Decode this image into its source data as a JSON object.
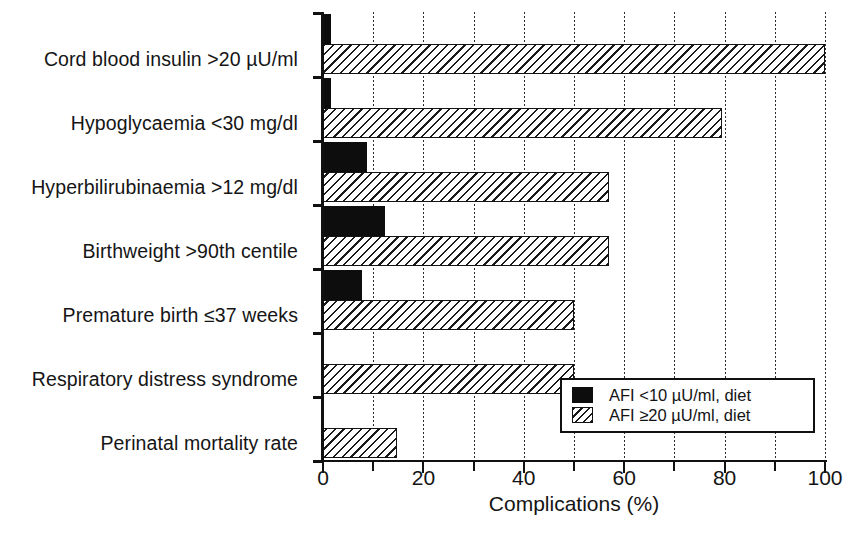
{
  "chart_data": {
    "type": "bar",
    "orientation": "horizontal",
    "title": "",
    "xlabel": "Complications (%)",
    "ylabel": "",
    "xlim": [
      0,
      100
    ],
    "xticks": [
      0,
      20,
      40,
      60,
      80,
      100
    ],
    "xtick_labels": [
      "0",
      "20",
      "40",
      "60",
      "80",
      "100"
    ],
    "minor_xticks": [
      10,
      30,
      50,
      70,
      90
    ],
    "gridlines": {
      "x_every": 10,
      "style": "dotted",
      "y": false
    },
    "categories": [
      "Cord blood insulin >20 µU/ml",
      "Hypoglycaemia <30 mg/dl",
      "Hyperbilirubinaemia >12 mg/dl",
      "Birthweight >90th centile",
      "Premature birth ≤37 weeks",
      "Respiratory distress syndrome",
      "Perinatal mortality rate"
    ],
    "series": [
      {
        "name": "AFI <10 µU/ml, diet",
        "pattern": "solid-black",
        "color": "#0d0d0d",
        "values": [
          1.5,
          1.5,
          8.8,
          12.4,
          7.8,
          0,
          0
        ]
      },
      {
        "name": "AFI ≥20 µU/ml, diet",
        "pattern": "hatched",
        "color": "#ffffff",
        "values": [
          100,
          79.5,
          57,
          57,
          50,
          50,
          14.7
        ]
      }
    ],
    "legend": {
      "position": "bottom-right",
      "entries": [
        {
          "label": "AFI <10 µU/ml, diet",
          "pattern": "solid-black"
        },
        {
          "label": "AFI ≥20 µU/ml, diet",
          "pattern": "hatched"
        }
      ]
    }
  }
}
